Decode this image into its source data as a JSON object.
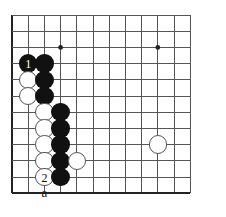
{
  "diagram": {
    "kind": "go-board-diagram",
    "board": {
      "cols": 12,
      "rows": 12,
      "origin_x": 12,
      "origin_y": 15,
      "spacing": 16.2,
      "line_color": "#555555",
      "edge_color": "#222222",
      "background": "#ffffff",
      "stone_radius": 9.2
    },
    "star_points": [
      {
        "col": 4,
        "row": 3
      },
      {
        "col": 10,
        "row": 3
      }
    ],
    "stones": [
      {
        "col": 2,
        "row": 4,
        "color": "black",
        "label": "1"
      },
      {
        "col": 3,
        "row": 4,
        "color": "black",
        "label": ""
      },
      {
        "col": 2,
        "row": 5,
        "color": "white",
        "label": ""
      },
      {
        "col": 3,
        "row": 5,
        "color": "black",
        "label": ""
      },
      {
        "col": 2,
        "row": 6,
        "color": "white",
        "label": ""
      },
      {
        "col": 3,
        "row": 6,
        "color": "black",
        "label": ""
      },
      {
        "col": 3,
        "row": 7,
        "color": "white",
        "label": ""
      },
      {
        "col": 4,
        "row": 7,
        "color": "black",
        "label": ""
      },
      {
        "col": 3,
        "row": 8,
        "color": "white",
        "label": ""
      },
      {
        "col": 4,
        "row": 8,
        "color": "black",
        "label": ""
      },
      {
        "col": 3,
        "row": 9,
        "color": "white",
        "label": ""
      },
      {
        "col": 4,
        "row": 9,
        "color": "black",
        "label": ""
      },
      {
        "col": 3,
        "row": 10,
        "color": "white",
        "label": ""
      },
      {
        "col": 4,
        "row": 10,
        "color": "black",
        "label": ""
      },
      {
        "col": 5,
        "row": 10,
        "color": "white",
        "label": ""
      },
      {
        "col": 3,
        "row": 11,
        "color": "white",
        "label": "2"
      },
      {
        "col": 4,
        "row": 11,
        "color": "black",
        "label": ""
      },
      {
        "col": 10,
        "row": 9,
        "color": "white",
        "label": ""
      }
    ],
    "coordinate_labels": [
      {
        "text": "a",
        "col": 3,
        "row": 12
      }
    ],
    "colors": {
      "black_stone": "#111111",
      "white_stone": "#ffffff",
      "white_stone_border": "#555555",
      "grid": "#555555",
      "border": "#222222",
      "label_on_black": "#ffffff",
      "label_on_white": "#111111"
    }
  }
}
